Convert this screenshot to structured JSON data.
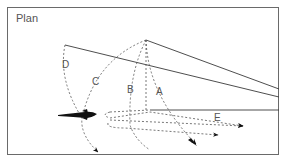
{
  "diagram": {
    "title": "Plan",
    "labels": {
      "a": "A",
      "b": "B",
      "c": "C",
      "d": "D",
      "e": "E"
    },
    "colors": {
      "line": "#3a3a3a",
      "dashed": "#555555",
      "fish": "#111111",
      "frame": "#6a6a6a",
      "text": "#555555"
    },
    "icons": {
      "fish": "fish-silhouette-icon",
      "arrowhead": "arrowhead-icon"
    }
  }
}
